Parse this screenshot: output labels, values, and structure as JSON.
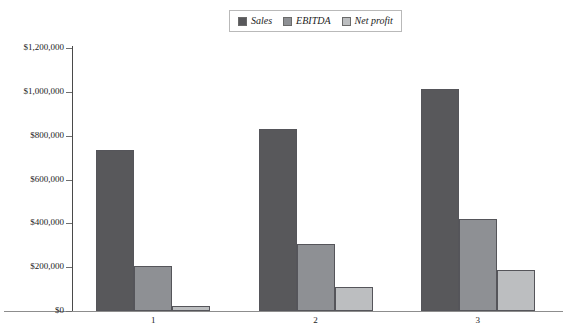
{
  "chart_data": {
    "type": "bar",
    "title": "",
    "xlabel": "",
    "ylabel": "",
    "categories": [
      "1",
      "2",
      "3"
    ],
    "series": [
      {
        "name": "Sales",
        "color": "#58585b",
        "values": [
          735000,
          830000,
          1015000
        ]
      },
      {
        "name": "EBITDA",
        "color": "#8e9094",
        "values": [
          207000,
          305000,
          420000
        ]
      },
      {
        "name": "Net profit",
        "color": "#bcbec0",
        "values": [
          25000,
          110000,
          185000
        ]
      }
    ],
    "ylim": [
      0,
      1200000
    ],
    "ytick_values": [
      0,
      200000,
      400000,
      600000,
      800000,
      1000000,
      1200000
    ],
    "ytick_labels": [
      "$0",
      "$200,000",
      "$400,000",
      "$600,000",
      "$800,000",
      "$1,000,000",
      "$1,200,000"
    ],
    "grid": false,
    "legend_position": "top-center",
    "bar_border_color": "#55555a"
  },
  "legend": {
    "entries": [
      {
        "label": "Sales"
      },
      {
        "label": "EBITDA"
      },
      {
        "label": "Net profit"
      }
    ]
  },
  "axes": {
    "y_axis_color": "#4a4a4a",
    "x_axis_color": "#8d8d8d"
  }
}
